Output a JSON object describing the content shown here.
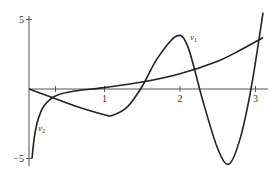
{
  "chart_data": {
    "type": "line",
    "title": "",
    "xlabel": "",
    "ylabel": "",
    "xlim": [
      0,
      3.2
    ],
    "ylim": [
      -5.3,
      5.2
    ],
    "grid": false,
    "legend": "inline labels",
    "x_ticks": [
      {
        "value": 0.35,
        "label": ""
      },
      {
        "value": 1,
        "label": "1"
      },
      {
        "value": 2,
        "label": "2"
      },
      {
        "value": 3,
        "label": "3"
      }
    ],
    "y_ticks": [
      {
        "value": 5,
        "label": "5"
      },
      {
        "value": -5,
        "label": "−5"
      }
    ],
    "series": [
      {
        "name": "v1",
        "label_main": "v",
        "label_sub": "1",
        "x": [
          0,
          0.3,
          0.6,
          1.0,
          1.1,
          1.3,
          1.5,
          1.7,
          1.95,
          2.1,
          2.3,
          2.5,
          2.65,
          2.8,
          2.95,
          3.1
        ],
        "y": [
          0,
          -0.6,
          -1.2,
          -1.85,
          -1.9,
          -1.3,
          0.2,
          2.2,
          3.8,
          3.1,
          -0.8,
          -4.3,
          -5.4,
          -3.5,
          0.3,
          5.5
        ]
      },
      {
        "name": "v2",
        "label_main": "v",
        "label_sub": "2",
        "x": [
          0.04,
          0.07,
          0.12,
          0.2,
          0.35,
          0.6,
          1.0,
          1.5,
          2.0,
          2.5,
          2.8,
          3.1
        ],
        "y": [
          -5.0,
          -3.5,
          -2.2,
          -1.2,
          -0.5,
          -0.15,
          0.1,
          0.5,
          1.1,
          2.0,
          2.8,
          3.7
        ]
      }
    ]
  }
}
